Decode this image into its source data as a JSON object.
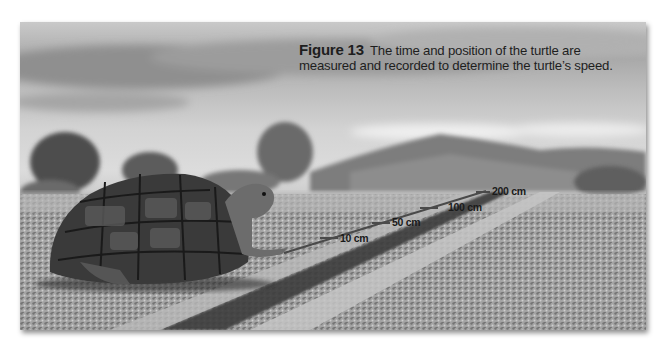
{
  "figure": {
    "label": "Figure 13",
    "caption_line1": "The time and position of the turtle are",
    "caption_line2": "measured and recorded to determine the turtle’s speed."
  },
  "photo": {
    "subject": "desert tortoise walking along a road",
    "palette": "grayscale"
  },
  "distance_markers": [
    {
      "value": 10,
      "unit": "cm",
      "label": "10 cm"
    },
    {
      "value": 50,
      "unit": "cm",
      "label": "50 cm"
    },
    {
      "value": 100,
      "unit": "cm",
      "label": "100 cm"
    },
    {
      "value": 200,
      "unit": "cm",
      "label": "200 cm"
    }
  ]
}
